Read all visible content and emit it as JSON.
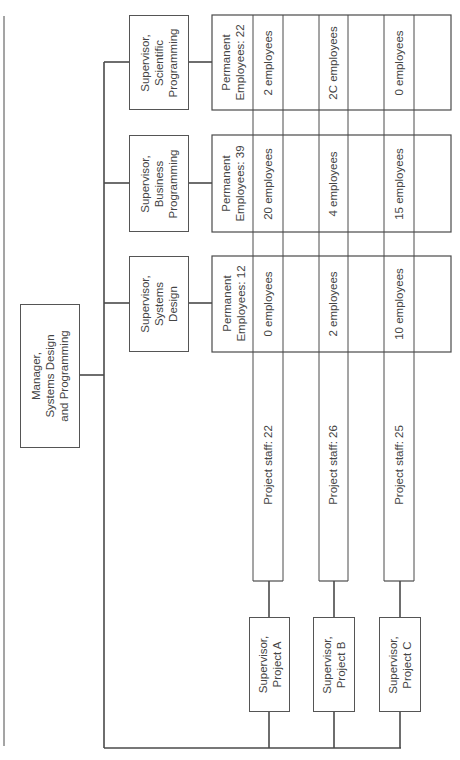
{
  "chart": {
    "orientation": "rotated-90-ccw",
    "manager": {
      "lines": [
        "Manager,",
        "Systems Design",
        "and Programming"
      ]
    },
    "functional_supervisors": [
      {
        "id": "scientific",
        "lines": [
          "Supervisor,",
          "Scientific",
          "Programming"
        ],
        "permanent_lines": [
          "Permanent",
          "Employees: 22"
        ],
        "permanent_employees": 22,
        "allocations": [
          "2 employees",
          "2C employees",
          "0 employees"
        ]
      },
      {
        "id": "business",
        "lines": [
          "Supervisor,",
          "Business",
          "Programming"
        ],
        "permanent_lines": [
          "Permanent",
          "Employees: 39"
        ],
        "permanent_employees": 39,
        "allocations": [
          "20 employees",
          "4 employees",
          "15 employees"
        ]
      },
      {
        "id": "systems",
        "lines": [
          "Supervisor,",
          "Systems",
          "Design"
        ],
        "permanent_lines": [
          "Permanent",
          "Employees: 12"
        ],
        "permanent_employees": 12,
        "allocations": [
          "0 employees",
          "2 employees",
          "10 employees"
        ]
      }
    ],
    "projects": [
      {
        "id": "A",
        "lines": [
          "Supervisor,",
          "Project A"
        ],
        "staff_label": "Project staff: 22",
        "staff": 22
      },
      {
        "id": "B",
        "lines": [
          "Supervisor,",
          "Project B"
        ],
        "staff_label": "Project staff: 26",
        "staff": 26
      },
      {
        "id": "C",
        "lines": [
          "Supervisor,",
          "Project C"
        ],
        "staff_label": "Project staff: 25",
        "staff": 25
      }
    ],
    "colors": {
      "line": "#444444",
      "text": "#444444",
      "background": "#ffffff"
    }
  }
}
